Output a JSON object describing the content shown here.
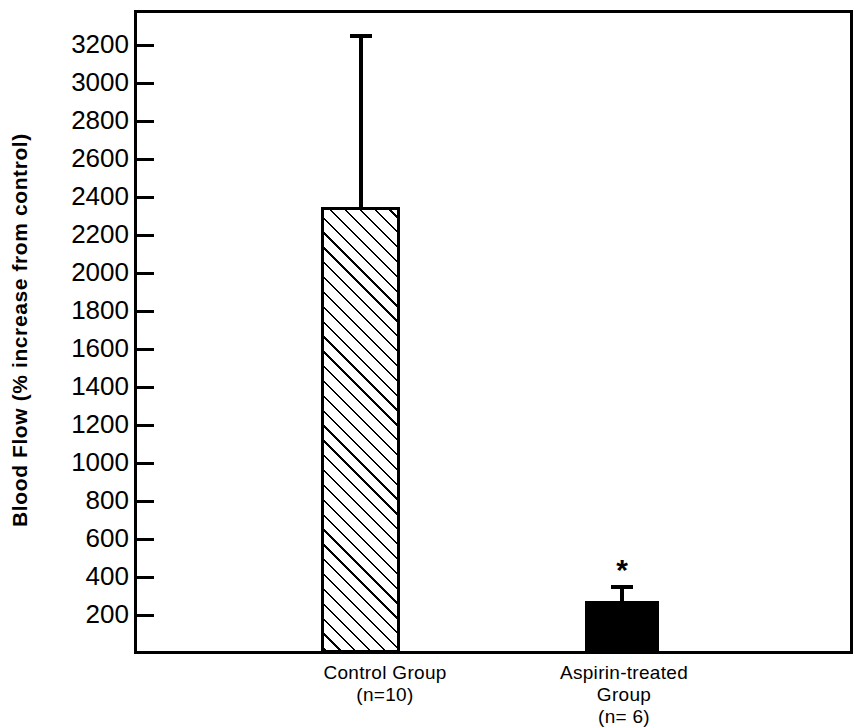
{
  "chart_data": {
    "type": "bar",
    "title": "",
    "xlabel": "",
    "ylabel": "Blood Flow (% increase from control)",
    "categories": [
      "Control Group\n(n=10)",
      "Aspirin-treated\nGroup\n(n= 6)"
    ],
    "category_names": [
      "Control Group",
      "Aspirin-treated Group"
    ],
    "sample_sizes": [
      "(n=10)",
      "(n= 6)"
    ],
    "values": [
      2350,
      275
    ],
    "errors_upper": [
      910,
      85
    ],
    "error_tops": [
      3260,
      360
    ],
    "ylim": [
      0,
      3300
    ],
    "yticks": [
      3200,
      3000,
      2800,
      2600,
      2400,
      2200,
      2000,
      1800,
      1600,
      1400,
      1200,
      1000,
      800,
      600,
      400,
      200
    ],
    "ytick_labels": [
      "3200",
      "3000",
      "2800",
      "2600",
      "2400",
      "2200",
      "2000",
      "1800",
      "1600",
      "1400",
      "1200",
      "1000",
      "800",
      "600",
      "400",
      "200"
    ],
    "grid": false,
    "legend": null,
    "annotations": [
      {
        "text": "*",
        "series": 1,
        "meaning": "significance-marker"
      }
    ],
    "bar_styles": [
      "diagonal-hatch",
      "solid-black"
    ],
    "colors": {
      "axis": "#000000",
      "bar_control_fill": "#ffffff",
      "bar_control_hatch": "#000000",
      "bar_aspirin_fill": "#000000",
      "background": "#ffffff"
    }
  },
  "axis": {
    "y_title": "Blood Flow (% increase from control)"
  },
  "series": [
    {
      "label_line1": "Control Group",
      "label_line2": "(n=10)",
      "value": 2350,
      "error_top": 3260
    },
    {
      "label_line1": "Aspirin-treated",
      "label_line2": "Group",
      "label_line3": "(n= 6)",
      "value": 275,
      "error_top": 360,
      "marker": "*"
    }
  ],
  "ticks": {
    "labels": [
      "3200",
      "3000",
      "2800",
      "2600",
      "2400",
      "2200",
      "2000",
      "1800",
      "1600",
      "1400",
      "1200",
      "1000",
      "800",
      "600",
      "400",
      "200"
    ]
  }
}
